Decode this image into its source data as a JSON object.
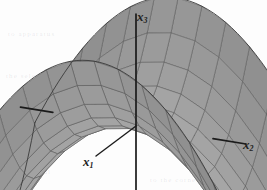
{
  "figure": {
    "kind": "3d-surface-plot",
    "background_color": "#fdfdfd",
    "axes": [
      {
        "name": "x1",
        "label_html": "x",
        "subscript": "1",
        "label_text": "x1"
      },
      {
        "name": "x2",
        "label_html": "x",
        "subscript": "2",
        "label_text": "x2"
      },
      {
        "name": "x3",
        "label_html": "x",
        "subscript": "3",
        "label_text": "x3"
      }
    ],
    "axis_color": "#1b1b1b",
    "surface": {
      "fill_color": "#9a9a9a",
      "fill_color_light": "#b4b4b4",
      "fill_color_dark": "#7e7e7e",
      "mesh_color": "#5a5a5a",
      "edge_color": "#3a3a3a",
      "grid_divisions_u": 12,
      "grid_divisions_v": 12
    },
    "ghost_text": [
      "to  apparatus",
      "and  referring",
      "the  selection",
      "fall",
      "1 2",
      "the normal",
      "to the corner of"
    ]
  },
  "chart_data": {
    "type": "surface",
    "title": "",
    "xlabel": "x1",
    "ylabel": "x2",
    "zlabel": "x3",
    "equation": "x3 = x1^2 - x2^2",
    "surface_form": "hyperbolic paraboloid (saddle)",
    "xlim": [
      -1,
      1
    ],
    "ylim": [
      -1,
      1
    ],
    "zlim": [
      -1,
      1
    ],
    "grid": true,
    "legend": "none",
    "annotations": [
      "saddle point located at the coordinate origin",
      "surface curves upward along the x1 direction",
      "surface curves downward along the x2 direction"
    ],
    "projection": {
      "type": "oblique-3d",
      "origin_px": [
        136,
        126
      ],
      "x1_axis_tip_px": [
        96,
        156
      ],
      "x2_axis_tip_px": [
        246,
        144
      ],
      "x3_axis_tip_px": [
        136,
        14
      ]
    }
  }
}
